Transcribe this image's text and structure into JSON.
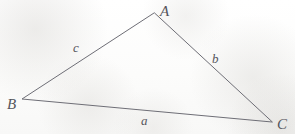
{
  "figure": {
    "kind": "geometry-diagram",
    "shape": "triangle",
    "width": 295,
    "height": 134,
    "background_color": "#fdfdfc",
    "stroke_color": "#6e6e76",
    "label_color": "#55555c",
    "stroke_width": 1
  },
  "vertices": [
    {
      "name": "A",
      "label": "A",
      "x": 154,
      "y": 13
    },
    {
      "name": "B",
      "label": "B",
      "x": 22,
      "y": 99
    },
    {
      "name": "C",
      "label": "C",
      "x": 272,
      "y": 122
    }
  ],
  "sides": [
    {
      "name": "a",
      "label": "a",
      "from": "B",
      "to": "C",
      "label_x": 145,
      "label_y": 122
    },
    {
      "name": "b",
      "label": "b",
      "from": "A",
      "to": "C",
      "label_x": 217,
      "label_y": 60
    },
    {
      "name": "c",
      "label": "c",
      "from": "A",
      "to": "B",
      "label_x": 78,
      "label_y": 48
    }
  ],
  "chart_data": {
    "type": "diagram",
    "title": "",
    "subtitle": "",
    "xlabel": "",
    "ylabel": "",
    "points": [
      {
        "id": "A",
        "x": 154,
        "y": 13
      },
      {
        "id": "B",
        "x": 22,
        "y": 99
      },
      {
        "id": "C",
        "x": 272,
        "y": 122
      }
    ],
    "edges": [
      {
        "id": "c",
        "from": "A",
        "to": "B"
      },
      {
        "id": "b",
        "from": "A",
        "to": "C"
      },
      {
        "id": "a",
        "from": "B",
        "to": "C"
      }
    ],
    "annotations": [
      "A",
      "B",
      "C",
      "a",
      "b",
      "c"
    ],
    "grid": false,
    "legend": "none"
  },
  "geometry": {
    "polygon_points": "154,13 22,99 272,122"
  }
}
